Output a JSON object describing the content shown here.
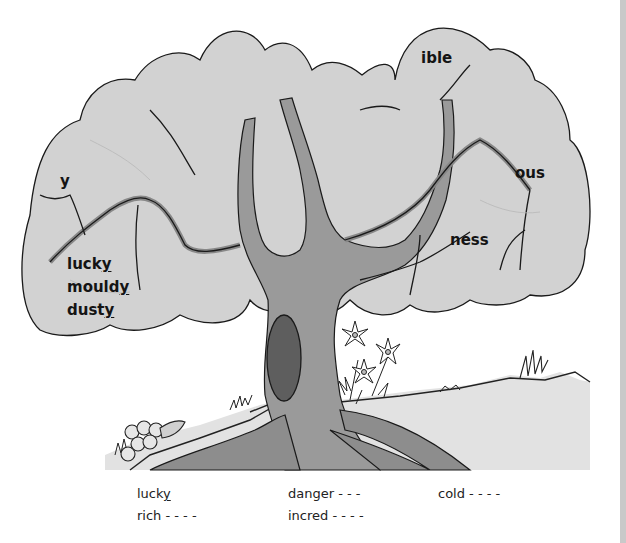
{
  "illustration": {
    "description": "Word-suffix tree with flowers and grass",
    "colors": {
      "foliage": "#d2d2d2",
      "foliage_outline": "#1a1a1a",
      "trunk": "#9a9a9a",
      "trunk_dark": "#7e7e7e",
      "hollow": "#5e5e5e",
      "ground": "#bdbdbd",
      "page_edge": "#c9c9c9"
    }
  },
  "tree_labels": {
    "suffix_y": "y",
    "suffix_ible": "ible",
    "suffix_ous": "ous",
    "suffix_ness": "ness",
    "branch_words": [
      {
        "stem": "luck",
        "ending": "y"
      },
      {
        "stem": "mould",
        "ending": "y"
      },
      {
        "stem": "dust",
        "ending": "y"
      }
    ]
  },
  "word_list": {
    "col1": [
      {
        "stem": "luck",
        "ending": "y",
        "blanks": ""
      },
      {
        "stem": "rich",
        "ending": "",
        "blanks": " - - - -"
      }
    ],
    "col2": [
      {
        "stem": "danger",
        "ending": "",
        "blanks": " - - -"
      },
      {
        "stem": "incred",
        "ending": "",
        "blanks": " - - - -"
      }
    ],
    "col3": [
      {
        "stem": "cold",
        "ending": "",
        "blanks": " - - - -"
      }
    ]
  }
}
